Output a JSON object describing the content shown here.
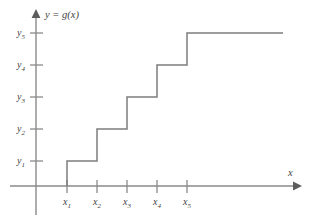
{
  "figure": {
    "background_color": "#ffffff",
    "line_color": "#7d7d7d",
    "axis_color": "#8a8a8a",
    "text_color": "#3f3f3f",
    "y_axis_caption": "y = g(x)",
    "x_axis_caption": "x"
  },
  "axis_labels": {
    "y": [
      {
        "base": "y",
        "sub": "1"
      },
      {
        "base": "y",
        "sub": "2"
      },
      {
        "base": "y",
        "sub": "3"
      },
      {
        "base": "y",
        "sub": "4"
      },
      {
        "base": "y",
        "sub": "5"
      }
    ],
    "x": [
      {
        "base": "x",
        "sub": "1"
      },
      {
        "base": "x",
        "sub": "2"
      },
      {
        "base": "x",
        "sub": "3"
      },
      {
        "base": "x",
        "sub": "4"
      },
      {
        "base": "x",
        "sub": "5"
      }
    ]
  },
  "chart_data": {
    "type": "line",
    "subtype": "step",
    "title": "",
    "subtitle": "",
    "xlabel": "x",
    "ylabel": "y = g(x)",
    "grid": false,
    "legend": false,
    "legend_position": "none",
    "step_mode": "post",
    "xticklabels": [
      "x1",
      "x2",
      "x3",
      "x4",
      "x5"
    ],
    "yticklabels": [
      "y1",
      "y2",
      "y3",
      "y4",
      "y5"
    ],
    "x_tick_values": [
      1,
      2,
      3,
      4,
      5
    ],
    "y_tick_values": [
      1,
      2,
      3,
      4,
      5
    ],
    "xlim": [
      0,
      8.7
    ],
    "ylim": [
      0,
      6.4
    ],
    "series": [
      {
        "name": "g(x)",
        "color": "#7d7d7d",
        "description": "Increasing right-continuous step function; jumps upward by one level at each x_i",
        "points": [
          {
            "x": 1,
            "y": 0
          },
          {
            "x": 1,
            "y": 1
          },
          {
            "x": 2,
            "y": 1
          },
          {
            "x": 2,
            "y": 2
          },
          {
            "x": 3,
            "y": 2
          },
          {
            "x": 3,
            "y": 3
          },
          {
            "x": 4,
            "y": 3
          },
          {
            "x": 4,
            "y": 4
          },
          {
            "x": 5,
            "y": 4
          },
          {
            "x": 5,
            "y": 5
          },
          {
            "x": 8.2,
            "y": 5
          }
        ],
        "segments": [
          {
            "from_x": "x1",
            "to_x": "x2",
            "level": "y1"
          },
          {
            "from_x": "x2",
            "to_x": "x3",
            "level": "y2"
          },
          {
            "from_x": "x3",
            "to_x": "x4",
            "level": "y3"
          },
          {
            "from_x": "x4",
            "to_x": "x5",
            "level": "y4"
          },
          {
            "from_x": "x5",
            "to_x": "end",
            "level": "y5"
          }
        ]
      }
    ]
  },
  "geometry": {
    "y_axis_x": 36,
    "x_axis_y": 186,
    "y_tick_px": [
      161,
      129,
      97,
      65,
      33
    ],
    "x_tick_px": [
      67,
      97,
      127,
      157,
      187
    ],
    "step_path": "M 67,186 L 67,161 L 97,161 L 97,129 L 127,129 L 127,97 L 157,97 L 157,65 L 187,65 L 187,33 L 283,33",
    "y_axis_top": 11,
    "y_axis_bottom": 215,
    "x_axis_left": 10,
    "x_axis_right": 300
  }
}
